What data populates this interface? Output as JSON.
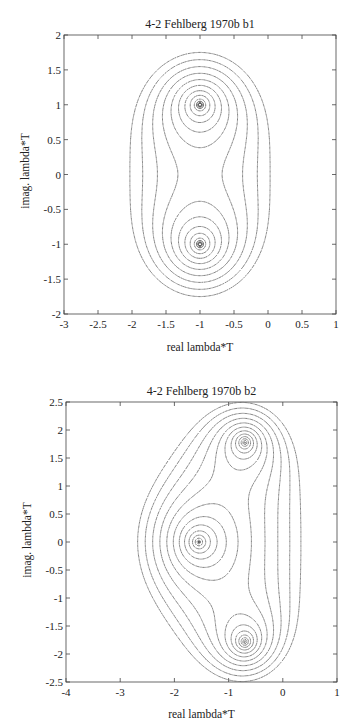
{
  "chart_data": [
    {
      "type": "contour",
      "title": "4-2 Fehlberg 1970b b1",
      "xlabel": "real lambda*T",
      "ylabel": "imag. lambda*T",
      "xlim": [
        -3,
        1
      ],
      "ylim": [
        -2,
        2
      ],
      "xticks": [
        -3,
        -2.5,
        -2,
        -1.5,
        -1,
        -0.5,
        0,
        0.5,
        1
      ],
      "xtick_labels": [
        "-3",
        "-2.5",
        "-2",
        "-1.5",
        "-1",
        "-0.5",
        "0",
        "0.5",
        "1"
      ],
      "yticks": [
        -2,
        -1.5,
        -1,
        -0.5,
        0,
        0.5,
        1,
        1.5,
        2
      ],
      "ytick_labels": [
        "-2",
        "-1.5",
        "-1",
        "-0.5",
        "0",
        "0.5",
        "1",
        "1.5",
        "2"
      ],
      "grid": false,
      "legend": null,
      "centers": [
        [
          -1,
          1
        ],
        [
          -1,
          -1
        ]
      ],
      "levels_solid": [
        0.17,
        0.2,
        0.25
      ],
      "levels_dotted": [
        0.32,
        0.42,
        0.52,
        0.62,
        0.72,
        0.82,
        0.92,
        1.02,
        1.12
      ],
      "region_x_extent": [
        -2.0,
        0.0
      ],
      "region_y_extent": [
        -1.75,
        1.75
      ],
      "frame_px": {
        "left": 64,
        "top": 35,
        "right": 336,
        "bottom": 314
      }
    },
    {
      "type": "contour",
      "title": "4-2 Fehlberg 1970b b2",
      "xlabel": "real lambda*T",
      "ylabel": "imag. lambda*T",
      "xlim": [
        -4,
        1
      ],
      "ylim": [
        -2.5,
        2.5
      ],
      "xticks": [
        -4,
        -3,
        -2,
        -1,
        0,
        1
      ],
      "xtick_labels": [
        "-4",
        "-3",
        "-2",
        "-1",
        "0",
        "1"
      ],
      "yticks": [
        -2.5,
        -2,
        -1.5,
        -1,
        -0.5,
        0,
        0.5,
        1,
        1.5,
        2,
        2.5
      ],
      "ytick_labels": [
        "-2.5",
        "-2",
        "-1.5",
        "-1",
        "-0.5",
        "0",
        "0.5",
        "1",
        "1.5",
        "2",
        "2.5"
      ],
      "grid": false,
      "legend": null,
      "centers": [
        [
          -1.55,
          0
        ],
        [
          -0.7,
          1.78
        ],
        [
          -0.7,
          -1.78
        ]
      ],
      "levels_solid": [
        0.12,
        0.15,
        0.19,
        0.24
      ],
      "levels_dotted": [
        0.3,
        0.38,
        0.46,
        0.54,
        0.62,
        0.7,
        0.78,
        0.86,
        0.94,
        1.02,
        1.1,
        1.18
      ],
      "region_x_extent": [
        -2.6,
        0.05
      ],
      "region_y_extent": [
        -2.35,
        2.35
      ],
      "frame_px": {
        "left": 66,
        "top": 402,
        "right": 337,
        "bottom": 682
      }
    }
  ]
}
